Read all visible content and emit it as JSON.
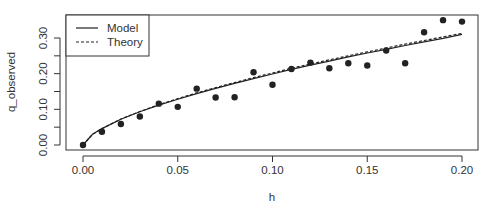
{
  "chart_data": {
    "type": "scatter",
    "title": "",
    "xlabel": "h",
    "ylabel": "q_observed",
    "xlim": [
      0.0,
      0.2
    ],
    "ylim": [
      0.0,
      0.33
    ],
    "x_ticks": [
      0.0,
      0.05,
      0.1,
      0.15,
      0.2
    ],
    "x_tick_labels": [
      "0.00",
      "0.05",
      "0.10",
      "0.15",
      "0.20"
    ],
    "y_ticks": [
      0.0,
      0.05,
      0.1,
      0.15,
      0.2,
      0.25,
      0.3
    ],
    "y_tick_labels": [
      "0.00",
      "",
      "0.10",
      "",
      "0.20",
      "",
      "0.30"
    ],
    "grid": false,
    "legend_position": "top-left",
    "points": {
      "name": "Observed",
      "x": [
        0.0,
        0.01,
        0.02,
        0.03,
        0.04,
        0.05,
        0.06,
        0.07,
        0.08,
        0.09,
        0.1,
        0.11,
        0.12,
        0.13,
        0.14,
        0.15,
        0.16,
        0.17,
        0.18,
        0.19,
        0.2
      ],
      "y": [
        0.0,
        0.037,
        0.059,
        0.08,
        0.116,
        0.107,
        0.158,
        0.133,
        0.134,
        0.204,
        0.169,
        0.213,
        0.231,
        0.215,
        0.229,
        0.223,
        0.265,
        0.229,
        0.316,
        0.35,
        0.346
      ]
    },
    "series": [
      {
        "name": "Model",
        "style": "solid",
        "x": [
          0.0,
          0.005,
          0.01,
          0.02,
          0.03,
          0.04,
          0.05,
          0.06,
          0.07,
          0.08,
          0.09,
          0.1,
          0.11,
          0.12,
          0.13,
          0.14,
          0.15,
          0.16,
          0.17,
          0.18,
          0.19,
          0.2
        ],
        "y": [
          0.0,
          0.03,
          0.046,
          0.072,
          0.093,
          0.112,
          0.128,
          0.144,
          0.159,
          0.173,
          0.186,
          0.199,
          0.212,
          0.224,
          0.235,
          0.247,
          0.258,
          0.268,
          0.279,
          0.289,
          0.299,
          0.31
        ]
      },
      {
        "name": "Theory",
        "style": "dashed",
        "x": [
          0.0,
          0.005,
          0.01,
          0.02,
          0.03,
          0.04,
          0.05,
          0.06,
          0.07,
          0.08,
          0.09,
          0.1,
          0.11,
          0.12,
          0.13,
          0.14,
          0.15,
          0.16,
          0.17,
          0.18,
          0.19,
          0.2
        ],
        "y": [
          0.0,
          0.03,
          0.046,
          0.073,
          0.094,
          0.113,
          0.13,
          0.146,
          0.161,
          0.175,
          0.189,
          0.202,
          0.215,
          0.227,
          0.239,
          0.25,
          0.261,
          0.272,
          0.283,
          0.293,
          0.303,
          0.313
        ]
      }
    ],
    "colors": {
      "points": "#222222",
      "lines": "#222222",
      "axis": "#333333",
      "text": "#333333"
    }
  },
  "legend": {
    "items": [
      {
        "label": "Model",
        "style": "solid"
      },
      {
        "label": "Theory",
        "style": "dashed"
      }
    ]
  }
}
